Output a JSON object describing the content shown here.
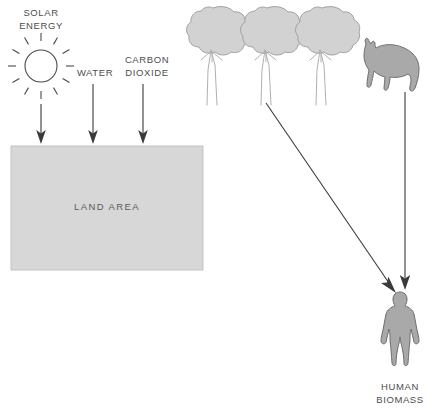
{
  "diagram": {
    "background_color": "#ffffff",
    "canvas": {
      "width": 441,
      "height": 410
    },
    "colors": {
      "text": "#4d4d4d",
      "land_fill": "#d7d7d7",
      "land_stroke": "#c4c4c4",
      "tree_canopy_fill": "#d2d2d2",
      "tree_canopy_stroke": "#9a9a9a",
      "tree_trunk_stroke": "#b0b0b0",
      "silhouette_fill": "#a9a9a9",
      "silhouette_stroke": "#6e6e6e",
      "arrow": "#3a3a3a",
      "line_art": "#4a4a4a"
    },
    "labels": {
      "solar_energy_line1": "SOLAR",
      "solar_energy_line2": "ENERGY",
      "water": "WATER",
      "carbon_dioxide_line1": "CARBON",
      "carbon_dioxide_line2": "DIOXIDE",
      "land_area": "LAND AREA",
      "human_biomass_line1": "HUMAN",
      "human_biomass_line2": "BIOMASS"
    },
    "inputs": [
      {
        "name": "solar-energy",
        "label": "SOLAR ENERGY",
        "arrow_x": 41
      },
      {
        "name": "water",
        "label": "WATER",
        "arrow_x": 93
      },
      {
        "name": "carbon-dioxide",
        "label": "CARBON DIOXIDE",
        "arrow_x": 143
      }
    ],
    "producers": {
      "trees": {
        "count": 3,
        "icon": "tree-icon"
      },
      "livestock": {
        "count": 1,
        "icon": "cow-icon"
      }
    },
    "output": {
      "icon": "human-figure-icon",
      "label": "HUMAN BIOMASS"
    },
    "flows": [
      {
        "name": "trees-to-human",
        "from": "trees",
        "to": "human-biomass",
        "style": "diagonal-arrow"
      },
      {
        "name": "livestock-to-human",
        "from": "cow",
        "to": "human-biomass",
        "style": "vertical-arrow"
      }
    ]
  }
}
